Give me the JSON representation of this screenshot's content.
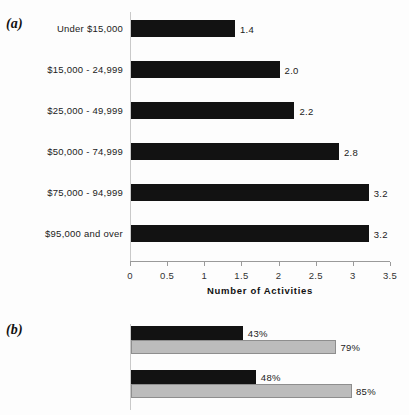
{
  "figure": {
    "panel_a_label": "(a)",
    "panel_b_label": "(b)"
  },
  "colors": {
    "bar_dark": "#121212",
    "bar_light": "#bcbcbc",
    "bar_light_border": "#8e8e8e",
    "axis": "#9a9a9a",
    "background": "#fdfdfd",
    "text": "#1b1b1b"
  },
  "chart_data": [
    {
      "type": "bar",
      "orientation": "horizontal",
      "panel": "(a)",
      "title": "",
      "xlabel": "Number of Activities",
      "ylabel": "",
      "xlim": [
        0,
        3.5
      ],
      "xticks": [
        "0",
        "0.5",
        "1",
        "1.5",
        "2",
        "2.5",
        "3",
        "3.5"
      ],
      "xtick_values": [
        0,
        0.5,
        1,
        1.5,
        2,
        2.5,
        3,
        3.5
      ],
      "grid": false,
      "legend": "none",
      "categories": [
        "Under $15,000",
        "$15,000 - 24,999",
        "$25,000 - 49,999",
        "$50,000 - 74,999",
        "$75,000 - 94,999",
        "$95,000 and over"
      ],
      "values": [
        1.4,
        2.0,
        2.2,
        2.8,
        3.2,
        3.2
      ],
      "value_labels": [
        "1.4",
        "2.0",
        "2.2",
        "2.8",
        "3.2",
        "3.2"
      ]
    },
    {
      "type": "bar",
      "orientation": "horizontal",
      "panel": "(b)",
      "title": "",
      "xlabel": "",
      "ylabel": "",
      "xlim": [
        0,
        100
      ],
      "xticks": [],
      "grid": false,
      "legend": "none",
      "note": "bottom group is cut off by the image edge; its label is illegible",
      "categories": [
        "Vote 1996",
        "Vote 2000",
        ""
      ],
      "series": [
        {
          "name": "dark",
          "values": [
            43,
            48,
            3
          ],
          "value_labels": [
            "43%",
            "48%",
            "3%"
          ]
        },
        {
          "name": "light",
          "values": [
            79,
            85,
            null
          ],
          "value_labels": [
            "79%",
            "85%",
            ""
          ]
        }
      ]
    }
  ]
}
